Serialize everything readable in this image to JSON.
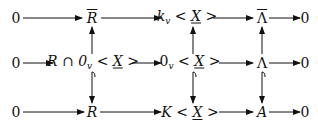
{
  "diagram": {
    "type": "commutative-diagram",
    "rows": [
      {
        "nodes": [
          {
            "id": "top-0-left",
            "label": "0"
          },
          {
            "id": "top-r-bar",
            "label": "R",
            "decoration": "overline"
          },
          {
            "id": "top-kv-x",
            "label_main": "k",
            "label_sub": "v",
            "label_rest_pre": " < ",
            "label_x": "X",
            "label_rest_post": " >"
          },
          {
            "id": "top-lambda-bar",
            "label": "Λ",
            "decoration": "overline"
          },
          {
            "id": "top-0-right",
            "label": "0"
          }
        ]
      },
      {
        "nodes": [
          {
            "id": "mid-0-left",
            "label": "0"
          },
          {
            "id": "mid-r-cap",
            "label_main": "R ∩ 0",
            "label_sub": "v",
            "label_rest_pre": " < ",
            "label_x": "X",
            "label_rest_post": " >"
          },
          {
            "id": "mid-0v-x",
            "label_main": "0",
            "label_sub": "v",
            "label_rest_pre": " < ",
            "label_x": "X",
            "label_rest_post": " >"
          },
          {
            "id": "mid-lambda",
            "label": "Λ"
          },
          {
            "id": "mid-0-right",
            "label": "0"
          }
        ]
      },
      {
        "nodes": [
          {
            "id": "bot-0-left",
            "label": "0"
          },
          {
            "id": "bot-r",
            "label": "R"
          },
          {
            "id": "bot-k-x",
            "label_main": "K",
            "label_rest_pre": " < ",
            "label_x": "X",
            "label_rest_post": " >"
          },
          {
            "id": "bot-a",
            "label": "A"
          },
          {
            "id": "bot-0-right",
            "label": "0"
          }
        ]
      }
    ],
    "arrows": [
      {
        "from": "top-0-left",
        "to": "top-r-bar",
        "style": "plain"
      },
      {
        "from": "top-r-bar",
        "to": "top-kv-x",
        "style": "plain"
      },
      {
        "from": "top-kv-x",
        "to": "top-lambda-bar",
        "style": "plain"
      },
      {
        "from": "top-lambda-bar",
        "to": "top-0-right",
        "style": "plain"
      },
      {
        "from": "mid-0-left",
        "to": "mid-r-cap",
        "style": "plain"
      },
      {
        "from": "mid-r-cap",
        "to": "mid-0v-x",
        "style": "plain"
      },
      {
        "from": "mid-0v-x",
        "to": "mid-lambda",
        "style": "plain"
      },
      {
        "from": "mid-lambda",
        "to": "mid-0-right",
        "style": "plain"
      },
      {
        "from": "bot-0-left",
        "to": "bot-r",
        "style": "plain"
      },
      {
        "from": "bot-r",
        "to": "bot-k-x",
        "style": "plain"
      },
      {
        "from": "bot-k-x",
        "to": "bot-a",
        "style": "plain"
      },
      {
        "from": "bot-a",
        "to": "bot-0-right",
        "style": "plain"
      },
      {
        "from": "mid-r-cap",
        "to": "top-r-bar",
        "style": "plain"
      },
      {
        "from": "mid-0v-x",
        "to": "top-kv-x",
        "style": "plain"
      },
      {
        "from": "mid-lambda",
        "to": "top-lambda-bar",
        "style": "plain"
      },
      {
        "from": "mid-r-cap",
        "to": "bot-r",
        "style": "hook"
      },
      {
        "from": "mid-0v-x",
        "to": "bot-k-x",
        "style": "hook"
      },
      {
        "from": "mid-lambda",
        "to": "bot-a",
        "style": "hook"
      }
    ]
  }
}
